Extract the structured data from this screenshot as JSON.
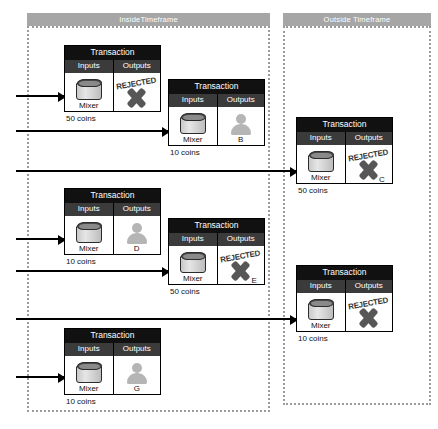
{
  "diagram": {
    "panels": [
      {
        "id": "inside",
        "label": "InsideTimeframe"
      },
      {
        "id": "outside",
        "label": "Outside Timeframe"
      }
    ],
    "labels": {
      "transaction": "Transaction",
      "inputs": "Inputs",
      "outputs": "Outputs",
      "mixer": "Mixer",
      "rejected": "REJECTED"
    },
    "colors": {
      "panel_header_bg": "#a6a6a6",
      "panel_border": "#9b9b9b",
      "txn_title_bg": "#111111",
      "col_head_bg": "#3b3b3b",
      "icon_gray": "#b5b5b5",
      "stamp_gray": "#575757"
    },
    "transactions": [
      {
        "id": "tx1",
        "panel": "inside",
        "title": "Transaction",
        "input": {
          "type": "mixer-icon",
          "label": "Mixer"
        },
        "output": {
          "type": "rejected-icon",
          "stamp": "REJECTED",
          "label": ""
        },
        "amount": "50 coins"
      },
      {
        "id": "tx2",
        "panel": "inside",
        "title": "Transaction",
        "input": {
          "type": "mixer-icon",
          "label": "Mixer"
        },
        "output": {
          "type": "person-icon",
          "label": "B"
        },
        "amount": "10 coins"
      },
      {
        "id": "tx3",
        "panel": "outside",
        "title": "Transaction",
        "input": {
          "type": "mixer-icon",
          "label": "Mixer"
        },
        "output": {
          "type": "rejected-icon",
          "stamp": "REJECTED",
          "label": "C"
        },
        "amount": "50 coins"
      },
      {
        "id": "tx4",
        "panel": "inside",
        "title": "Transaction",
        "input": {
          "type": "mixer-icon",
          "label": "Mixer"
        },
        "output": {
          "type": "person-icon",
          "label": "D"
        },
        "amount": "10 coins"
      },
      {
        "id": "tx5",
        "panel": "inside",
        "title": "Transaction",
        "input": {
          "type": "mixer-icon",
          "label": "Mixer"
        },
        "output": {
          "type": "rejected-icon",
          "stamp": "REJECTED",
          "label": "E"
        },
        "amount": "50 coins"
      },
      {
        "id": "tx6",
        "panel": "outside",
        "title": "Transaction",
        "input": {
          "type": "mixer-icon",
          "label": "Mixer"
        },
        "output": {
          "type": "rejected-icon",
          "stamp": "REJECTED",
          "label": ""
        },
        "amount": "10 coins"
      },
      {
        "id": "tx7",
        "panel": "inside",
        "title": "Transaction",
        "input": {
          "type": "mixer-icon",
          "label": "Mixer"
        },
        "output": {
          "type": "person-icon",
          "label": "G"
        },
        "amount": "10 coins"
      }
    ],
    "arrows": [
      {
        "id": "a1",
        "to": "tx1"
      },
      {
        "id": "a2",
        "to": "tx2"
      },
      {
        "id": "a3",
        "to": "tx3"
      },
      {
        "id": "a4",
        "to": "tx4"
      },
      {
        "id": "a5",
        "to": "tx5"
      },
      {
        "id": "a6",
        "to": "tx6"
      },
      {
        "id": "a7",
        "to": "tx7"
      }
    ]
  }
}
